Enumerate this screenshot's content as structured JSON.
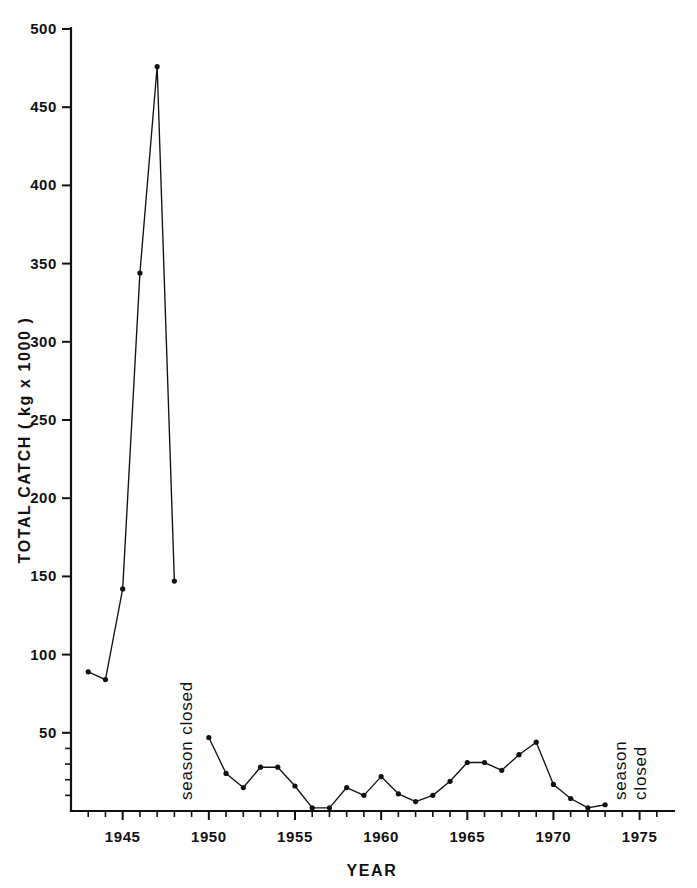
{
  "chart_data": {
    "type": "line",
    "title": "",
    "xlabel": "YEAR",
    "ylabel": "TOTAL  CATCH  ( kg x 1000 )",
    "xlim": [
      1942,
      1977
    ],
    "ylim": [
      0,
      500
    ],
    "grid": false,
    "legend": "none",
    "x_major_ticks": [
      1945,
      1950,
      1955,
      1960,
      1965,
      1970,
      1975
    ],
    "x_major_tick_labels": [
      "1945",
      "1950",
      "1955",
      "1960",
      "1965",
      "1970",
      "1975"
    ],
    "x_minor_tick_step": 1,
    "y_major_ticks": [
      50,
      100,
      150,
      200,
      250,
      300,
      350,
      400,
      450,
      500
    ],
    "y_major_tick_labels": [
      "50",
      "100",
      "150",
      "200",
      "250",
      "300",
      "350",
      "400",
      "450",
      "500"
    ],
    "y_minor_ticks": [
      10,
      20,
      30,
      40
    ],
    "series": [
      {
        "name": "total catch",
        "marker": "filled-circle",
        "x": [
          1943,
          1944,
          1945,
          1946,
          1947,
          1948,
          1950,
          1951,
          1952,
          1953,
          1954,
          1955,
          1956,
          1957,
          1958,
          1959,
          1960,
          1961,
          1962,
          1963,
          1964,
          1965,
          1966,
          1967,
          1968,
          1969,
          1970,
          1971,
          1972,
          1973
        ],
        "values": [
          89,
          84,
          142,
          344,
          476,
          147,
          47,
          24,
          15,
          28,
          28,
          16,
          2,
          2,
          15,
          10,
          22,
          11,
          6,
          10,
          19,
          31,
          31,
          26,
          36,
          44,
          17,
          8,
          2,
          4
        ],
        "gaps_after": [
          1948
        ]
      }
    ],
    "annotations": [
      {
        "text": "season closed",
        "lines": [
          "season closed"
        ],
        "orientation": "vertical",
        "x_year": 1949,
        "position": "left-gap"
      },
      {
        "text": "season closed",
        "lines": [
          "season",
          "closed"
        ],
        "orientation": "vertical",
        "x_year": 1974.2,
        "position": "right-gap"
      }
    ]
  },
  "axes": {
    "y_label_text": "TOTAL  CATCH  ( kg x 1000 )",
    "x_label_text": "YEAR"
  },
  "colors": {
    "ink": "#111111",
    "background": "#ffffff"
  }
}
